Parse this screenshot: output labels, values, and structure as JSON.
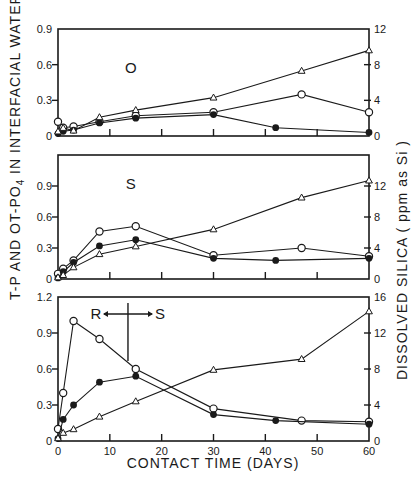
{
  "chart_data": {
    "type": "line",
    "title": "",
    "xlabel": "CONTACT TIME (DAYS)",
    "ylabel_left": "T-P AND OT-PO4 IN INTERFACIAL WATER (ppm as P)",
    "ylabel_right": "DISSOLVED SILICA (ppm as Si)",
    "xlim": [
      0,
      60
    ],
    "x_ticks": [
      0,
      10,
      20,
      30,
      40,
      50,
      60
    ],
    "grid": false,
    "legend": "none (markers: open circle = T-P, filled circle = OT-PO4, open triangle = dissolved silica)",
    "panels": [
      {
        "label": "O",
        "ylim_left": [
          0,
          0.9
        ],
        "left_ticks": [
          "0",
          "0.3",
          "0.6",
          "0.9"
        ],
        "ylim_right": [
          0,
          12
        ],
        "right_ticks": [
          "0",
          "4",
          "8",
          "12"
        ],
        "series": [
          {
            "name": "T-P",
            "marker": "open-circle",
            "axis": "left",
            "x": [
              0,
              1,
              3,
              8,
              15,
              30,
              47,
              60
            ],
            "values": [
              0.12,
              0.07,
              0.08,
              0.12,
              0.17,
              0.2,
              0.35,
              0.2
            ]
          },
          {
            "name": "OT-PO4",
            "marker": "filled-circle",
            "axis": "left",
            "x": [
              0,
              1,
              3,
              8,
              15,
              30,
              42,
              60
            ],
            "values": [
              0.02,
              0.04,
              0.05,
              0.11,
              0.15,
              0.18,
              0.07,
              0.03
            ]
          },
          {
            "name": "Dissolved Silica",
            "marker": "open-triangle",
            "axis": "right",
            "x": [
              0,
              1,
              3,
              8,
              15,
              30,
              47,
              60
            ],
            "values": [
              0.5,
              0.9,
              0.6,
              2.1,
              2.9,
              4.3,
              7.3,
              9.6
            ]
          }
        ]
      },
      {
        "label": "S",
        "ylim_left": [
          0,
          1.2
        ],
        "left_ticks": [
          "0",
          "0.3",
          "0.6",
          "0.9"
        ],
        "ylim_right": [
          0,
          16
        ],
        "right_ticks": [
          "0",
          "4",
          "8",
          "12"
        ],
        "series": [
          {
            "name": "T-P",
            "marker": "open-circle",
            "axis": "left",
            "x": [
              0,
              1,
              3,
              8,
              15,
              30,
              47,
              60
            ],
            "values": [
              0.05,
              0.1,
              0.18,
              0.46,
              0.51,
              0.23,
              0.3,
              0.22
            ]
          },
          {
            "name": "OT-PO4",
            "marker": "filled-circle",
            "axis": "left",
            "x": [
              0,
              1,
              3,
              8,
              15,
              30,
              42,
              60
            ],
            "values": [
              0.01,
              0.07,
              0.16,
              0.32,
              0.38,
              0.2,
              0.18,
              0.2
            ]
          },
          {
            "name": "Dissolved Silica",
            "marker": "open-triangle",
            "axis": "right",
            "x": [
              0,
              1,
              3,
              8,
              15,
              30,
              47,
              60
            ],
            "values": [
              0.2,
              0.5,
              1.5,
              3.2,
              4.2,
              6.4,
              10.5,
              12.7
            ]
          }
        ]
      },
      {
        "label": "R←→S",
        "label_left": "R",
        "label_right": "S",
        "transition_day": 13.5,
        "ylim_left": [
          0,
          1.2
        ],
        "left_ticks": [
          "0",
          "0.3",
          "0.6",
          "0.9",
          "1.2"
        ],
        "ylim_right": [
          0,
          16
        ],
        "right_ticks": [
          "0",
          "4",
          "8",
          "12",
          "16"
        ],
        "series": [
          {
            "name": "T-P",
            "marker": "open-circle",
            "axis": "left",
            "x": [
              0,
              1,
              3,
              8,
              15,
              30,
              47,
              60
            ],
            "values": [
              0.1,
              0.4,
              1.0,
              0.85,
              0.6,
              0.27,
              0.17,
              0.16
            ]
          },
          {
            "name": "OT-PO4",
            "marker": "filled-circle",
            "axis": "left",
            "x": [
              0,
              1,
              3,
              8,
              15,
              30,
              42,
              60
            ],
            "values": [
              0.02,
              0.18,
              0.3,
              0.49,
              0.54,
              0.22,
              0.17,
              0.14
            ]
          },
          {
            "name": "Dissolved Silica",
            "marker": "open-triangle",
            "axis": "right",
            "x": [
              0,
              1,
              3,
              8,
              15,
              30,
              47,
              60
            ],
            "values": [
              0.3,
              0.9,
              1.3,
              2.7,
              4.4,
              7.9,
              9.1,
              14.4
            ]
          }
        ]
      }
    ]
  },
  "labels": {
    "x_axis_title": "CONTACT  TIME  (DAYS)",
    "y_left_title": "T-P AND OT-PO",
    "y_left_sub": "4",
    "y_left_rest": " IN INTERFACIAL  WATER  ( ppm as P )",
    "y_right_title": "DISSOLVED    SILICA   ( ppm as Si )"
  },
  "layout": {
    "x_left": 58,
    "x_right": 369,
    "panels": [
      {
        "top": 29,
        "bottom": 136
      },
      {
        "top": 155,
        "bottom": 279
      },
      {
        "top": 297,
        "bottom": 441
      }
    ]
  }
}
